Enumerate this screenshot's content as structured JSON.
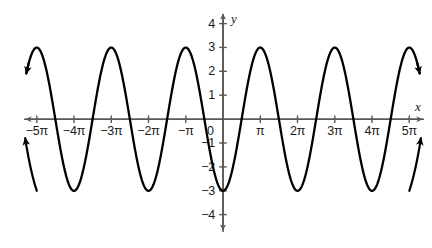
{
  "chart_data": {
    "type": "line",
    "title": "",
    "subtitle": "",
    "xlabel": "x",
    "ylabel": "y",
    "function": "y = -3cos(x)",
    "amplitude": 3,
    "period_label": "2π",
    "xlim": [
      -16.4934,
      16.4934
    ],
    "ylim": [
      -4.6,
      4.6
    ],
    "grid": false,
    "legend": null,
    "x_unit": "pi",
    "x_tick_values": [
      -5,
      -4,
      -3,
      -2,
      -1,
      0,
      1,
      2,
      3,
      4,
      5
    ],
    "x_tick_labels": [
      "−5π",
      "−4π",
      "−3π",
      "−2π",
      "−π",
      "0",
      "π",
      "2π",
      "3π",
      "4π",
      "5π"
    ],
    "y_tick_values": [
      4,
      3,
      2,
      1,
      -1,
      -2,
      -3,
      -4
    ],
    "y_tick_labels": [
      "4",
      "3",
      "2",
      "1",
      "−1",
      "−2",
      "−3",
      "−4"
    ],
    "origin_label": "0",
    "maxima": [
      {
        "x": -4,
        "y": 3
      },
      {
        "x": -2,
        "y": 3
      },
      {
        "x": 2,
        "y": 3
      },
      {
        "x": 4,
        "y": 3
      }
    ],
    "minima": [
      {
        "x": -5,
        "y": -3
      },
      {
        "x": -3,
        "y": -3
      },
      {
        "x": -1,
        "y": -3
      },
      {
        "x": 0,
        "y": -3
      },
      {
        "x": 1,
        "y": -3
      },
      {
        "x": 3,
        "y": -3
      },
      {
        "x": 5,
        "y": -3
      }
    ],
    "x_intercepts_pi_halves": [
      -4.5,
      -3.5,
      -2.5,
      -1.5,
      -0.5,
      0.5,
      1.5,
      2.5,
      3.5,
      4.5
    ],
    "curve_color": "#000000",
    "axis_color": "#595959",
    "text_color": "#1a1a1a",
    "has_axis_arrows": true,
    "has_curve_arrows": true
  },
  "axes": {
    "x_name": "x",
    "y_name": "y"
  }
}
